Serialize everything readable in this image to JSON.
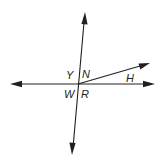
{
  "diagram": {
    "type": "intersecting-lines-angle-diagram",
    "colors": {
      "stroke": "#231f20",
      "background": "#ffffff"
    },
    "intersection": {
      "x": 78,
      "y": 84
    },
    "lines": [
      {
        "id": "vertical-line",
        "from": [
          72,
          155
        ],
        "to": [
          85,
          12
        ],
        "arrows": "both"
      },
      {
        "id": "horizontal-line",
        "from": [
          10,
          84
        ],
        "to": [
          155,
          84
        ],
        "arrows": "both"
      }
    ],
    "rays": [
      {
        "id": "ray-h",
        "from": [
          78,
          84
        ],
        "to": [
          150,
          63
        ],
        "arrows": "end"
      }
    ],
    "labels": {
      "y": "Y",
      "n": "N",
      "w": "W",
      "r": "R",
      "h": "H"
    }
  }
}
